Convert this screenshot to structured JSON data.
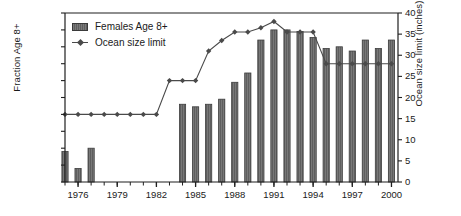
{
  "chart_data": {
    "type": "bar",
    "title": "",
    "xlabel": "",
    "ylabel": "Fraction Age 8+",
    "ylabel_right": "Ocean size limit (inches)",
    "xlim": [
      1975,
      2000.5
    ],
    "ylim": [
      0,
      1
    ],
    "ylim_right": [
      0,
      40
    ],
    "grid": false,
    "legend_position": "top-left",
    "categories": [
      1975,
      1976,
      1977,
      1978,
      1979,
      1980,
      1981,
      1982,
      1983,
      1984,
      1985,
      1986,
      1987,
      1988,
      1989,
      1990,
      1991,
      1992,
      1993,
      1994,
      1995,
      1996,
      1997,
      1998,
      1999,
      2000
    ],
    "xticks": [
      1976,
      1979,
      1982,
      1985,
      1988,
      1991,
      1994,
      1997,
      2000
    ],
    "yticks_left": [
      0,
      0.1,
      0.2,
      0.3,
      0.4,
      0.5,
      0.6,
      0.7,
      0.8,
      0.9,
      1
    ],
    "yticks_right": [
      0,
      5,
      10,
      15,
      20,
      25,
      30,
      35,
      40
    ],
    "series": [
      {
        "name": "Females Age 8+",
        "type": "bar",
        "axis": "left",
        "color": "#6e6e6e",
        "values": [
          0.18,
          0.08,
          0.2,
          null,
          null,
          null,
          null,
          null,
          null,
          0.46,
          0.445,
          0.46,
          0.49,
          0.59,
          0.645,
          0.84,
          0.9,
          0.9,
          0.89,
          0.855,
          0.79,
          0.8,
          0.775,
          0.84,
          0.79,
          0.84
        ]
      },
      {
        "name": "Ocean size limit",
        "type": "line",
        "axis": "right",
        "color": "#4a4a4a",
        "values": [
          16,
          16,
          16,
          16,
          16,
          16,
          16,
          16,
          24,
          24,
          24,
          31,
          33.5,
          35.5,
          35.5,
          36.5,
          38,
          35.5,
          35.5,
          35.5,
          28,
          28,
          28,
          28,
          28,
          28
        ]
      }
    ]
  },
  "legend": {
    "items": [
      {
        "label": "Females Age 8+",
        "marker": "bar-swatch"
      },
      {
        "label": "Ocean size limit",
        "marker": "line-diamond-swatch"
      }
    ]
  },
  "axis_left": {
    "title": "Fraction Age 8+",
    "ticks": [
      "0",
      "0.1",
      "0.2",
      "0.3",
      "0.4",
      "0.5",
      "0.6",
      "0.7",
      "0.8",
      "0.9",
      "1"
    ]
  },
  "axis_right": {
    "title": "Ocean size limit (inches)",
    "ticks": [
      "0",
      "5",
      "10",
      "15",
      "20",
      "25",
      "30",
      "35",
      "40"
    ]
  },
  "axis_bottom": {
    "ticks": [
      "1976",
      "1979",
      "1982",
      "1985",
      "1988",
      "1991",
      "1994",
      "1997",
      "2000"
    ]
  },
  "colors": {
    "bar": "#6e6e6e",
    "bar_edge": "#3c3c3c",
    "line": "#4a4a4a",
    "axis": "#1f1f1f",
    "background": "#ffffff"
  }
}
